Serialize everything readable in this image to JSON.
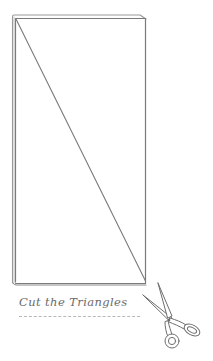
{
  "diagram": {
    "caption": "Cut the Triangles",
    "colors": {
      "line": "#7a7a7a",
      "line_light": "#a8a8a8",
      "caption": "#6a6a6a",
      "rule": "#b8b8b8",
      "background": "#ffffff"
    },
    "fabric_rectangle": {
      "x": 13,
      "y": 16,
      "width": 133,
      "height": 268,
      "layers": 2
    },
    "cut_line": {
      "from": [
        15,
        18
      ],
      "to": [
        146,
        281
      ],
      "label": "diagonal"
    },
    "icons": [
      "scissors-icon"
    ]
  }
}
